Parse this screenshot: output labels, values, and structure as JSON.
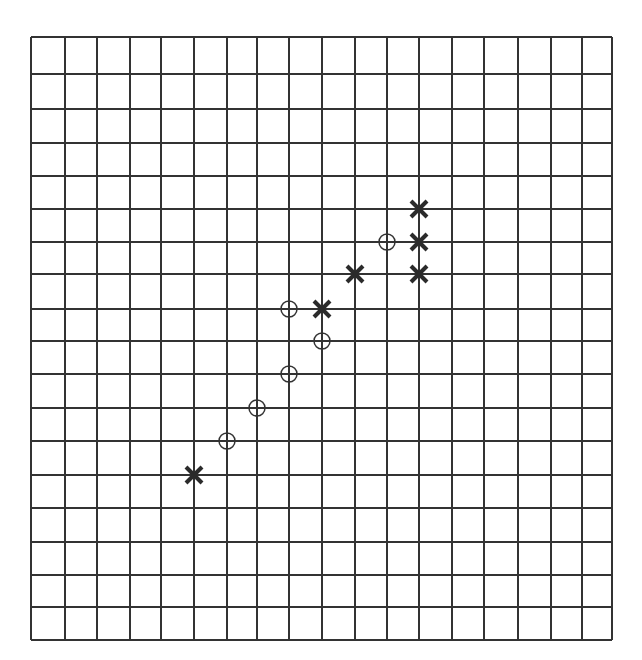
{
  "board": {
    "columns": 18,
    "rows": 18,
    "x_lines": [
      31,
      65,
      97,
      130,
      161,
      194,
      227,
      257,
      289,
      322,
      355,
      387,
      419,
      452,
      484,
      518,
      551,
      582,
      612
    ],
    "y_lines": [
      37,
      74,
      109,
      143,
      176,
      209,
      242,
      274,
      309,
      341,
      374,
      408,
      441,
      475,
      508,
      542,
      575,
      607,
      640
    ],
    "line_color": "#333333",
    "background": "#ffffff"
  },
  "pieces": [
    {
      "type": "x",
      "col": 12,
      "row": 5
    },
    {
      "type": "x",
      "col": 12,
      "row": 6
    },
    {
      "type": "x",
      "col": 12,
      "row": 7
    },
    {
      "type": "x",
      "col": 10,
      "row": 7
    },
    {
      "type": "x",
      "col": 9,
      "row": 8
    },
    {
      "type": "x",
      "col": 5,
      "row": 13
    },
    {
      "type": "o",
      "col": 11,
      "row": 6
    },
    {
      "type": "o",
      "col": 8,
      "row": 8
    },
    {
      "type": "o",
      "col": 9,
      "row": 9
    },
    {
      "type": "o",
      "col": 8,
      "row": 10
    },
    {
      "type": "o",
      "col": 7,
      "row": 11
    },
    {
      "type": "o",
      "col": 6,
      "row": 12
    }
  ],
  "piece_style": {
    "x": {
      "color": "#2b2b2b",
      "half_size": 8,
      "stroke": 4
    },
    "o": {
      "color": "#333333",
      "radius": 8,
      "stroke": 1.5
    }
  }
}
